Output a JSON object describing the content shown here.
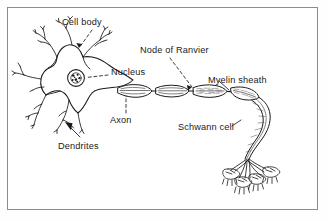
{
  "figure": {
    "kind": "biology-diagram",
    "background_color": "#ffffff",
    "ink_color": "#1a1a1a",
    "frame_color": "#8c8c8c"
  },
  "labels": [
    {
      "id": "cell-body",
      "text": "Cell body",
      "x": 62,
      "y": 17,
      "leader": "dashed-arrow-down"
    },
    {
      "id": "nucleus",
      "text": "Nucleus",
      "x": 111,
      "y": 72,
      "leader": "dashed-left"
    },
    {
      "id": "node-of-ranvier",
      "text": "Node of Ranvier",
      "x": 140,
      "y": 45,
      "leader": "dashed-arrow-down-left"
    },
    {
      "id": "myelin-sheath",
      "text": "Myelin sheath",
      "x": 208,
      "y": 80,
      "leader": "solid-down-left"
    },
    {
      "id": "axon",
      "text": "Axon",
      "x": 110,
      "y": 117,
      "leader": "dashed-up"
    },
    {
      "id": "dendrites",
      "text": "Dendrites",
      "x": 58,
      "y": 141,
      "leader": "solid-arrow-up-left"
    },
    {
      "id": "schwann-cell",
      "text": "Schwann cell",
      "x": 178,
      "y": 127,
      "leader": "solid-right"
    }
  ],
  "structures": [
    {
      "id": "soma",
      "name": "cell body / soma"
    },
    {
      "id": "nucleus-circle",
      "name": "nucleus"
    },
    {
      "id": "dendrite-tree",
      "name": "dendrites"
    },
    {
      "id": "axon-shaft",
      "name": "myelinated axon"
    },
    {
      "id": "myelin-segments",
      "name": "myelin sheath segments"
    },
    {
      "id": "ranvier-nodes",
      "name": "nodes of Ranvier"
    },
    {
      "id": "terminal-branches",
      "name": "axon terminal branches"
    },
    {
      "id": "end-plates",
      "name": "motor end plates"
    }
  ]
}
